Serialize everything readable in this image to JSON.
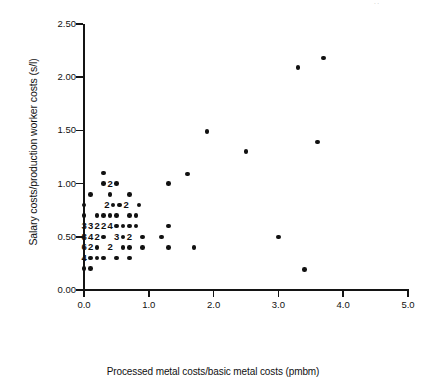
{
  "figure": {
    "artifact_mark": "··"
  },
  "chart_data": {
    "type": "scatter",
    "title": "",
    "xlabel": "Processed metal costs/basic metal costs (pmbm)",
    "ylabel": "Salary costs/production worker costs (s/l)",
    "xlim": [
      0.0,
      5.0
    ],
    "ylim": [
      0.0,
      2.5
    ],
    "grid": false,
    "legend": null,
    "xticks": [
      0.0,
      1.0,
      2.0,
      3.0,
      4.0,
      5.0
    ],
    "xtick_labels": [
      "0.0",
      "1.0",
      "2.0",
      "3.0",
      "4.0",
      "5.0"
    ],
    "yticks": [
      0.0,
      0.5,
      1.0,
      1.5,
      2.0,
      2.5
    ],
    "ytick_labels": [
      "0.00",
      "0.50",
      "1.00",
      "1.50",
      "2.00",
      "2.50"
    ],
    "marker": "filled-circle",
    "marker_color": "#111111",
    "note": "Overplotted points are annotated with a count digit in place of the marker",
    "points": [
      {
        "x": 0.0,
        "y": 0.2,
        "count": 1
      },
      {
        "x": 0.1,
        "y": 0.2,
        "count": 1
      },
      {
        "x": 0.0,
        "y": 0.3,
        "count": 4,
        "label": "4"
      },
      {
        "x": 0.1,
        "y": 0.3,
        "count": 1
      },
      {
        "x": 0.2,
        "y": 0.3,
        "count": 1
      },
      {
        "x": 0.3,
        "y": 0.3,
        "count": 1
      },
      {
        "x": 0.5,
        "y": 0.3,
        "count": 1
      },
      {
        "x": 0.7,
        "y": 0.3,
        "count": 1
      },
      {
        "x": 0.0,
        "y": 0.4,
        "count": 6,
        "label": "6"
      },
      {
        "x": 0.1,
        "y": 0.4,
        "count": 2,
        "label": "2"
      },
      {
        "x": 0.2,
        "y": 0.4,
        "count": 1
      },
      {
        "x": 0.4,
        "y": 0.4,
        "count": 2,
        "label": "2"
      },
      {
        "x": 0.6,
        "y": 0.4,
        "count": 1
      },
      {
        "x": 0.7,
        "y": 0.4,
        "count": 1
      },
      {
        "x": 0.9,
        "y": 0.4,
        "count": 1
      },
      {
        "x": 1.3,
        "y": 0.4,
        "count": 1
      },
      {
        "x": 1.7,
        "y": 0.4,
        "count": 1
      },
      {
        "x": 0.0,
        "y": 0.5,
        "count": 8,
        "label": "8"
      },
      {
        "x": 0.1,
        "y": 0.5,
        "count": 4,
        "label": "4"
      },
      {
        "x": 0.2,
        "y": 0.5,
        "count": 2,
        "label": "2"
      },
      {
        "x": 0.3,
        "y": 0.5,
        "count": 1
      },
      {
        "x": 0.5,
        "y": 0.5,
        "count": 3,
        "label": "3"
      },
      {
        "x": 0.6,
        "y": 0.5,
        "count": 1
      },
      {
        "x": 0.7,
        "y": 0.5,
        "count": 2,
        "label": "2"
      },
      {
        "x": 0.9,
        "y": 0.5,
        "count": 1
      },
      {
        "x": 1.2,
        "y": 0.5,
        "count": 1
      },
      {
        "x": 3.0,
        "y": 0.5,
        "count": 1
      },
      {
        "x": 0.0,
        "y": 0.6,
        "count": 3,
        "label": "3"
      },
      {
        "x": 0.1,
        "y": 0.6,
        "count": 3,
        "label": "3"
      },
      {
        "x": 0.2,
        "y": 0.6,
        "count": 2,
        "label": "2"
      },
      {
        "x": 0.3,
        "y": 0.6,
        "count": 2,
        "label": "2"
      },
      {
        "x": 0.4,
        "y": 0.6,
        "count": 4,
        "label": "4"
      },
      {
        "x": 0.5,
        "y": 0.6,
        "count": 1
      },
      {
        "x": 0.6,
        "y": 0.6,
        "count": 1
      },
      {
        "x": 0.7,
        "y": 0.6,
        "count": 1
      },
      {
        "x": 0.8,
        "y": 0.6,
        "count": 1
      },
      {
        "x": 1.3,
        "y": 0.6,
        "count": 1
      },
      {
        "x": 0.0,
        "y": 0.7,
        "count": 1
      },
      {
        "x": 0.2,
        "y": 0.7,
        "count": 1
      },
      {
        "x": 0.3,
        "y": 0.7,
        "count": 1
      },
      {
        "x": 0.4,
        "y": 0.7,
        "count": 1
      },
      {
        "x": 0.5,
        "y": 0.7,
        "count": 1
      },
      {
        "x": 0.7,
        "y": 0.7,
        "count": 1
      },
      {
        "x": 0.8,
        "y": 0.7,
        "count": 1
      },
      {
        "x": 0.0,
        "y": 0.8,
        "count": 1
      },
      {
        "x": 0.35,
        "y": 0.8,
        "count": 2,
        "label": "2"
      },
      {
        "x": 0.45,
        "y": 0.8,
        "count": 1
      },
      {
        "x": 0.55,
        "y": 0.8,
        "count": 1
      },
      {
        "x": 0.65,
        "y": 0.8,
        "count": 2,
        "label": "2"
      },
      {
        "x": 0.85,
        "y": 0.8,
        "count": 1
      },
      {
        "x": 0.1,
        "y": 0.9,
        "count": 1
      },
      {
        "x": 0.4,
        "y": 0.9,
        "count": 1
      },
      {
        "x": 0.7,
        "y": 0.9,
        "count": 1
      },
      {
        "x": 0.3,
        "y": 1.0,
        "count": 1
      },
      {
        "x": 0.4,
        "y": 1.0,
        "count": 2,
        "label": "2"
      },
      {
        "x": 0.5,
        "y": 1.0,
        "count": 1
      },
      {
        "x": 1.3,
        "y": 1.0,
        "count": 1
      },
      {
        "x": 0.3,
        "y": 1.1,
        "count": 1
      },
      {
        "x": 1.6,
        "y": 1.09,
        "count": 1
      },
      {
        "x": 2.5,
        "y": 1.3,
        "count": 1
      },
      {
        "x": 3.6,
        "y": 1.39,
        "count": 1
      },
      {
        "x": 1.9,
        "y": 1.49,
        "count": 1
      },
      {
        "x": 3.3,
        "y": 2.09,
        "count": 1
      },
      {
        "x": 3.7,
        "y": 2.18,
        "count": 1
      },
      {
        "x": 3.4,
        "y": 0.19,
        "count": 1
      }
    ]
  }
}
